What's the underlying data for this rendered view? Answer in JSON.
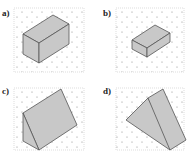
{
  "panels": [
    {
      "label": "a)",
      "shape": "cuboid"
    },
    {
      "label": "b)",
      "shape": "cuboid"
    },
    {
      "label": "c)",
      "shape": "triangular-prism"
    },
    {
      "label": "d)",
      "shape": "triangular-prism"
    }
  ],
  "colors": {
    "fill": "#c8c8c8",
    "stroke": "#555555",
    "dot": "#888888",
    "frame": "#bbbbbb"
  }
}
